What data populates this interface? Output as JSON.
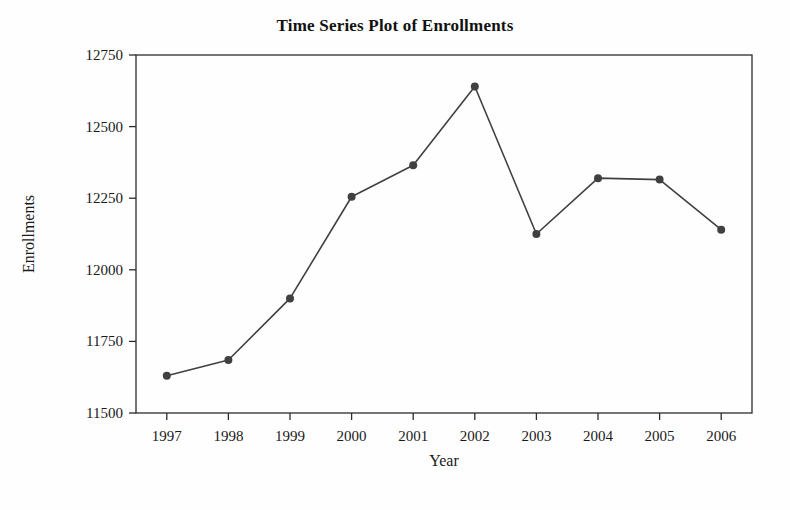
{
  "chart_data": {
    "type": "line",
    "title": "Time Series Plot of Enrollments",
    "xlabel": "Year",
    "ylabel": "Enrollments",
    "categories": [
      "1997",
      "1998",
      "1999",
      "2000",
      "2001",
      "2002",
      "2003",
      "2004",
      "2005",
      "2006"
    ],
    "values": [
      11630,
      11685,
      11900,
      12255,
      12365,
      12640,
      12125,
      12320,
      12315,
      12140
    ],
    "series": [
      {
        "name": "Enrollments",
        "values": [
          11630,
          11685,
          11900,
          12255,
          12365,
          12640,
          12125,
          12320,
          12315,
          12140
        ]
      }
    ],
    "ylim": [
      11500,
      12750
    ],
    "ytick_labels": [
      "11500",
      "11750",
      "12000",
      "12250",
      "12500",
      "12750"
    ],
    "ytick_values": [
      11500,
      11750,
      12000,
      12250,
      12500,
      12750
    ],
    "xtick_labels": [
      "1997",
      "1998",
      "1999",
      "2000",
      "2001",
      "2002",
      "2003",
      "2004",
      "2005",
      "2006"
    ],
    "grid": false,
    "legend": false,
    "legend_position": "none",
    "line_color": "#404040",
    "marker_color": "#404040",
    "marker_shape": "circle",
    "frame_color": "#2b2b2b",
    "background_color": "#fefefe"
  },
  "figure": {
    "title": "Time Series Plot of Enrollments"
  }
}
